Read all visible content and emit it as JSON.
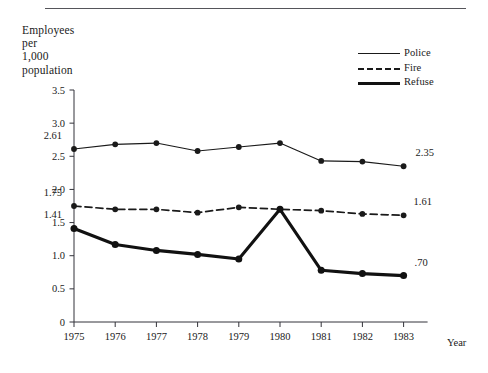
{
  "axis_title": "Employees\nper\n1,000\npopulation",
  "x_caption": "Year",
  "legend": {
    "items": [
      {
        "label": "Police",
        "style": "thin-solid",
        "color": "#1a1a1a"
      },
      {
        "label": "Fire",
        "style": "dashed",
        "color": "#1a1a1a"
      },
      {
        "label": "Refuse",
        "style": "thick-solid",
        "color": "#111111"
      }
    ]
  },
  "annotations": [
    {
      "text": "2.61",
      "series": "Police",
      "year": 1975
    },
    {
      "text": "2.35",
      "series": "Police",
      "year": 1983
    },
    {
      "text": "1.75",
      "series": "Fire",
      "year": 1975
    },
    {
      "text": "1.61",
      "series": "Fire",
      "year": 1983
    },
    {
      "text": "1.41",
      "series": "Refuse",
      "year": 1975
    },
    {
      "text": ".70",
      "series": "Refuse",
      "year": 1983
    }
  ],
  "chart_data": {
    "type": "line",
    "title": "Employees per 1,000 population",
    "xlabel": "Year",
    "ylabel": "Employees per 1,000 population",
    "categories": [
      1975,
      1976,
      1977,
      1978,
      1979,
      1980,
      1981,
      1982,
      1983
    ],
    "x": [
      "1975",
      "1976",
      "1977",
      "1978",
      "1979",
      "1980",
      "1981",
      "1982",
      "1983"
    ],
    "xtick_labels": [
      "1975",
      "1976",
      "1977",
      "1978",
      "1979",
      "1980",
      "1981",
      "1982",
      "1983"
    ],
    "ytick_labels": [
      "0",
      "0.5",
      "1.0",
      "1.5",
      "2.0",
      "2.5",
      "3.0",
      "3.5"
    ],
    "ytick_values": [
      0,
      0.5,
      1.0,
      1.5,
      2.0,
      2.5,
      3.0,
      3.5
    ],
    "ylim": [
      0,
      3.5
    ],
    "grid": false,
    "legend_position": "top-right",
    "series": [
      {
        "name": "Police",
        "style": "thin-solid",
        "color": "#1a1a1a",
        "values": [
          2.61,
          2.68,
          2.7,
          2.58,
          2.64,
          2.7,
          2.43,
          2.42,
          2.35
        ],
        "labels": {
          "1975": "2.61",
          "1983": "2.35"
        }
      },
      {
        "name": "Fire",
        "style": "dashed",
        "color": "#1a1a1a",
        "values": [
          1.75,
          1.7,
          1.7,
          1.65,
          1.73,
          1.7,
          1.68,
          1.63,
          1.61
        ],
        "labels": {
          "1975": "1.75",
          "1983": "1.61"
        }
      },
      {
        "name": "Refuse",
        "style": "thick-solid",
        "color": "#111111",
        "values": [
          1.41,
          1.17,
          1.08,
          1.02,
          0.95,
          1.7,
          0.78,
          0.73,
          0.7
        ],
        "labels": {
          "1975": "1.41",
          "1983": ".70"
        }
      }
    ]
  }
}
